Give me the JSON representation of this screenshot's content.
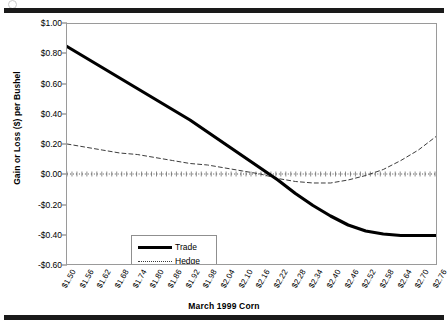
{
  "figure": {
    "top_rule": "horizontal-rule",
    "bottom_rule": "horizontal-rule",
    "scan_artifact": "circle-mark"
  },
  "chart_data": {
    "type": "line",
    "title": "",
    "xlabel": "March 1999 Corn",
    "ylabel": "Gain or Loss ($) per Bushel",
    "grid": false,
    "legend_position": "inside-lower-left",
    "ylim": [
      -0.6,
      1.0
    ],
    "yticks": [
      1.0,
      0.8,
      0.6,
      0.4,
      0.2,
      0.0,
      -0.2,
      -0.4,
      -0.6
    ],
    "ytick_labels": [
      "$1.00",
      "$0.80",
      "$0.60",
      "$0.40",
      "$0.20",
      "$0.00",
      "-$0.20",
      "-$0.40",
      "-$0.60"
    ],
    "categories": [
      "$1.50",
      "$1.56",
      "$1.62",
      "$1.68",
      "$1.74",
      "$1.80",
      "$1.86",
      "$1.92",
      "$1.98",
      "$2.04",
      "$2.10",
      "$2.16",
      "$2.22",
      "$2.28",
      "$2.34",
      "$2.40",
      "$2.46",
      "$2.52",
      "$2.58",
      "$2.64",
      "$2.70",
      "$2.76"
    ],
    "x": [
      1.5,
      1.56,
      1.62,
      1.68,
      1.74,
      1.8,
      1.86,
      1.92,
      1.98,
      2.04,
      2.1,
      2.16,
      2.22,
      2.28,
      2.34,
      2.4,
      2.46,
      2.52,
      2.58,
      2.64,
      2.7,
      2.76
    ],
    "zero_reference_line": 0.0,
    "series": [
      {
        "name": "Trade",
        "style": "solid-thick",
        "color": "#000000",
        "values": [
          0.85,
          0.78,
          0.71,
          0.64,
          0.57,
          0.5,
          0.43,
          0.36,
          0.28,
          0.2,
          0.12,
          0.04,
          -0.04,
          -0.13,
          -0.21,
          -0.28,
          -0.34,
          -0.38,
          -0.4,
          -0.41,
          -0.41,
          -0.41
        ]
      },
      {
        "name": "Hedge",
        "style": "dashed-thin",
        "color": "#3a3a3a",
        "values": [
          0.2,
          0.18,
          0.16,
          0.14,
          0.13,
          0.11,
          0.09,
          0.07,
          0.06,
          0.04,
          0.02,
          0.0,
          -0.03,
          -0.05,
          -0.06,
          -0.06,
          -0.04,
          -0.01,
          0.03,
          0.09,
          0.16,
          0.25
        ]
      }
    ]
  },
  "legend": {
    "items": [
      {
        "label": "Trade",
        "style": "solid"
      },
      {
        "label": "Hedge",
        "style": "dotted"
      }
    ]
  }
}
